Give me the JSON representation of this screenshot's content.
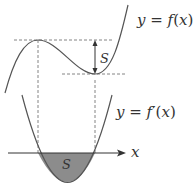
{
  "diagram": {
    "labels": {
      "f_curve": "y = f(x)",
      "f_curve_parts": {
        "y": "y",
        "eq": " = ",
        "f": "f",
        "open": "(",
        "x": "x",
        "close": ")"
      },
      "fprime_curve": "y = f′(x)",
      "fprime_curve_parts": {
        "y": "y",
        "eq": " = ",
        "f": "f",
        "prime": "′",
        "open": "(",
        "x": "x",
        "close": ")"
      },
      "gap_label": "S",
      "area_label": "S",
      "x_axis_label": "x"
    },
    "colors": {
      "curve": "#555555",
      "dashed": "#666666",
      "shaded_area": "#8c8c8c",
      "text": "#333333",
      "axis": "#333333"
    }
  }
}
